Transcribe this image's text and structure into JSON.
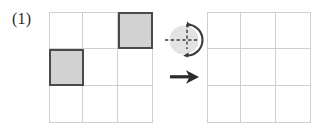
{
  "figure": {
    "label": "(1)",
    "colors": {
      "grid_line": "#cfcfcf",
      "shaded_fill": "#d2d2d2",
      "shaded_border": "#4a4a4a",
      "symbol_circle": "#e2e2e2",
      "symbol_stroke": "#3a3a3a",
      "arrow": "#2b2b2b",
      "background": "#ffffff",
      "label_text": "#2b2b2b"
    }
  },
  "source_grid": {
    "name": "source-grid",
    "rows": 3,
    "cols": 3,
    "shaded_cells": [
      {
        "row": 1,
        "col": 3,
        "label": "top-right"
      },
      {
        "row": 2,
        "col": 1,
        "label": "middle-left"
      }
    ]
  },
  "result_grid": {
    "name": "result-grid",
    "rows": 3,
    "cols": 3,
    "shaded_cells": []
  },
  "operators": {
    "rotation": {
      "name": "rotation-symbol",
      "icon": "rotation-icon",
      "description": "circle with dashed crosshair and curved double arrow"
    },
    "arrow": {
      "name": "transform-arrow",
      "icon": "arrow-right-icon",
      "description": "solid right-pointing arrow"
    }
  }
}
